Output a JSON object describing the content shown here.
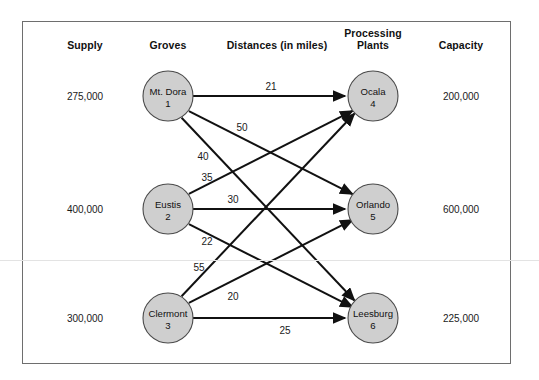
{
  "headers": {
    "supply": "Supply",
    "groves": "Groves",
    "distances": "Distances (in miles)",
    "plants_line1": "Processing",
    "plants_line2": "Plants",
    "capacity": "Capacity"
  },
  "supply_values": [
    "275,000",
    "400,000",
    "300,000"
  ],
  "capacity_values": [
    "200,000",
    "600,000",
    "225,000"
  ],
  "groves": [
    {
      "name": "Mt. Dora",
      "number": "1",
      "supply": "275,000"
    },
    {
      "name": "Eustis",
      "number": "2",
      "supply": "400,000"
    },
    {
      "name": "Clermont",
      "number": "3",
      "supply": "300,000"
    }
  ],
  "plants": [
    {
      "name": "Ocala",
      "number": "4",
      "capacity": "200,000"
    },
    {
      "name": "Orlando",
      "number": "5",
      "capacity": "600,000"
    },
    {
      "name": "Leesburg",
      "number": "6",
      "capacity": "225,000"
    }
  ],
  "edges": [
    {
      "from": "Mt. Dora",
      "to": "Ocala",
      "distance": "21"
    },
    {
      "from": "Mt. Dora",
      "to": "Orlando",
      "distance": "50"
    },
    {
      "from": "Mt. Dora",
      "to": "Leesburg",
      "distance": "40"
    },
    {
      "from": "Eustis",
      "to": "Ocala",
      "distance": "35"
    },
    {
      "from": "Eustis",
      "to": "Orlando",
      "distance": "30"
    },
    {
      "from": "Eustis",
      "to": "Leesburg",
      "distance": "22"
    },
    {
      "from": "Clermont",
      "to": "Ocala",
      "distance": "55"
    },
    {
      "from": "Clermont",
      "to": "Orlando",
      "distance": "20"
    },
    {
      "from": "Clermont",
      "to": "Leesburg",
      "distance": "25"
    }
  ],
  "colors": {
    "node_fill": "#cfcfcf",
    "node_stroke": "#4a4a4a",
    "edge": "#111111",
    "frame": "#6e6e6e",
    "text": "#111111"
  }
}
